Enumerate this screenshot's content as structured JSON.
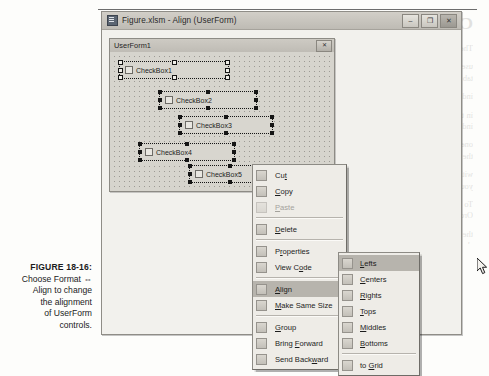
{
  "figure": {
    "number": "FIGURE 18-16:",
    "caption_lines": [
      "Choose Format ⇔",
      "Align to change",
      "the alignment",
      "of UserForm",
      "controls."
    ]
  },
  "vbe_window": {
    "title": "Figure.xlsm - Align (UserForm)",
    "icon": "vb-project-icon",
    "buttons": [
      {
        "name": "minimize-button",
        "glyph": "–"
      },
      {
        "name": "maximize-button",
        "glyph": "❐"
      },
      {
        "name": "close-button",
        "glyph": "✕"
      }
    ]
  },
  "userform": {
    "title": "UserForm1",
    "close_glyph": "✕",
    "controls": [
      {
        "caption": "CheckBox1",
        "selected": true,
        "x": 8,
        "y": 8,
        "w": 112,
        "h": 20
      },
      {
        "caption": "CheckBox2",
        "selected": true,
        "x": 48,
        "y": 38,
        "w": 100,
        "h": 20
      },
      {
        "caption": "CheckBox3",
        "selected": true,
        "x": 68,
        "y": 63,
        "w": 96,
        "h": 20
      },
      {
        "caption": "CheckBox4",
        "selected": true,
        "x": 28,
        "y": 90,
        "w": 98,
        "h": 20
      },
      {
        "caption": "CheckBox5",
        "selected": true,
        "x": 78,
        "y": 112,
        "w": 84,
        "h": 20
      }
    ]
  },
  "context_menu": {
    "items": [
      {
        "label": "Cut",
        "accel": "t",
        "icon": "cut-icon",
        "disabled": false,
        "submenu": false
      },
      {
        "label": "Copy",
        "accel": "C",
        "icon": "copy-icon",
        "disabled": false,
        "submenu": false
      },
      {
        "label": "Paste",
        "accel": "P",
        "icon": "paste-icon",
        "disabled": true,
        "submenu": false
      },
      {
        "separator": true
      },
      {
        "label": "Delete",
        "accel": "D",
        "icon": "delete-icon",
        "disabled": false,
        "submenu": false
      },
      {
        "separator": true
      },
      {
        "label": "Properties",
        "accel": "r",
        "icon": "properties-icon",
        "disabled": false,
        "submenu": false
      },
      {
        "label": "View Code",
        "accel": "o",
        "icon": "view-code-icon",
        "disabled": false,
        "submenu": false
      },
      {
        "separator": true
      },
      {
        "label": "Align",
        "accel": "A",
        "icon": "align-icon",
        "disabled": false,
        "submenu": true,
        "highlighted": true
      },
      {
        "label": "Make Same Size",
        "accel": "M",
        "icon": "same-size-icon",
        "disabled": false,
        "submenu": true
      },
      {
        "separator": true
      },
      {
        "label": "Group",
        "accel": "G",
        "icon": "group-icon",
        "disabled": false,
        "submenu": false
      },
      {
        "label": "Bring Forward",
        "accel": "F",
        "icon": "bring-forward-icon",
        "disabled": false,
        "submenu": false
      },
      {
        "label": "Send Backward",
        "accel": "w",
        "icon": "send-backward-icon",
        "disabled": false,
        "submenu": false
      }
    ]
  },
  "align_submenu": {
    "items": [
      {
        "label": "Lefts",
        "accel": "L",
        "icon": "align-lefts-icon",
        "highlighted": true
      },
      {
        "label": "Centers",
        "accel": "C",
        "icon": "align-centers-icon",
        "highlighted": false
      },
      {
        "label": "Rights",
        "accel": "R",
        "icon": "align-rights-icon",
        "highlighted": false
      },
      {
        "label": "Tops",
        "accel": "T",
        "icon": "align-tops-icon",
        "highlighted": false
      },
      {
        "label": "Middles",
        "accel": "M",
        "icon": "align-middles-icon",
        "highlighted": false
      },
      {
        "label": "Bottoms",
        "accel": "B",
        "icon": "align-bottoms-icon",
        "highlighted": false
      },
      {
        "separator": true
      },
      {
        "label": "to Grid",
        "accel": "G",
        "icon": "align-to-grid-icon",
        "highlighted": false
      }
    ]
  },
  "background_bleed": {
    "heading": "Changing the T…",
    "paragraphs": [
      "The tab order determines the order in which the",
      "user presses Tab. Each control on the form has a tab",
      "index — that is, an integer that determines its place",
      "in the sequence. For example, if a control has a tab index of",
      "one, it gets the focus if the user presses Tab from the control",
      "with a tab index of zero. By setting the tab order you can",
      "control the flow of data entry in a dialog box.",
      "",
      "To set the control tab order, choose View ⇒ Tab Order, or right-click",
      "the dialog box and choose Tab Order from the shortcut menu. You",
      "can then arrange the order by moving items up and down in the list."
    ]
  }
}
